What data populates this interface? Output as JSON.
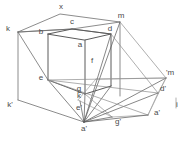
{
  "figure": {
    "width": 186,
    "height": 142,
    "background_color": "#ffffff",
    "stroke_color": "#565656",
    "light_stroke_color": "#9a9a9a",
    "label_color": "#4a4a4a",
    "label_font_size": 8
  },
  "labels": [
    {
      "id": "x",
      "text": "x",
      "x": 61,
      "y": 7
    },
    {
      "id": "k",
      "text": "k",
      "x": 8,
      "y": 29
    },
    {
      "id": "c",
      "text": "c",
      "x": 72,
      "y": 22
    },
    {
      "id": "m",
      "text": "m",
      "x": 121,
      "y": 16
    },
    {
      "id": "b",
      "text": "b",
      "x": 41,
      "y": 32
    },
    {
      "id": "d",
      "text": "d",
      "x": 110,
      "y": 29
    },
    {
      "id": "a",
      "text": "a",
      "x": 80,
      "y": 45
    },
    {
      "id": "f",
      "text": "f",
      "x": 92,
      "y": 61
    },
    {
      "id": "e",
      "text": "e",
      "x": 41,
      "y": 78
    },
    {
      "id": "g",
      "text": "g",
      "x": 79,
      "y": 89
    },
    {
      "id": "m-prime",
      "text": "'m",
      "x": 170,
      "y": 73
    },
    {
      "id": "k-prime",
      "text": "k'",
      "x": 10,
      "y": 105
    },
    {
      "id": "kk",
      "text": "k",
      "x": 79,
      "y": 96
    },
    {
      "id": "d-prime",
      "text": "d'",
      "x": 163,
      "y": 89
    },
    {
      "id": "e-prime",
      "text": "e'",
      "x": 79,
      "y": 108
    },
    {
      "id": "i",
      "text": "i",
      "x": 177,
      "y": 105
    },
    {
      "id": "a-prime-right",
      "text": "a'",
      "x": 157,
      "y": 113
    },
    {
      "id": "g-prime",
      "text": "g'",
      "x": 118,
      "y": 122
    },
    {
      "id": "a-prime",
      "text": "a'",
      "x": 84,
      "y": 129
    }
  ],
  "points": {
    "x": [
      60,
      14
    ],
    "k": [
      18,
      32
    ],
    "c": [
      72,
      29
    ],
    "m": [
      120,
      22
    ],
    "b": [
      48,
      34
    ],
    "d": [
      111,
      34
    ],
    "a": [
      103,
      40
    ],
    "f": [
      103,
      86
    ],
    "e": [
      48,
      80
    ],
    "g": [
      86,
      94
    ],
    "kTop": [
      18,
      32
    ],
    "kBot": [
      18,
      100
    ],
    "mBot": [
      120,
      96
    ],
    "dBot": [
      111,
      104
    ],
    "aPrime": [
      84,
      122
    ],
    "mPrime": [
      166,
      78
    ],
    "dPrimePt": [
      158,
      93
    ],
    "aPrimeRight": [
      148,
      115
    ],
    "gPrimePt": [
      112,
      117
    ],
    "ePrimePt": [
      78,
      112
    ],
    "kPt": [
      80,
      101
    ],
    "farRight": [
      176,
      98
    ]
  },
  "shapes": {
    "outer_box": "large translucent box with vertex k at left, x at top, m at right",
    "inner_cube": "solid small cube b-c-d-a-e-f-g",
    "ground_plane": "quadrilateral e-m'-a'-g'-a' fan",
    "projection_fan": "rays converging at a' bottom vertex"
  }
}
